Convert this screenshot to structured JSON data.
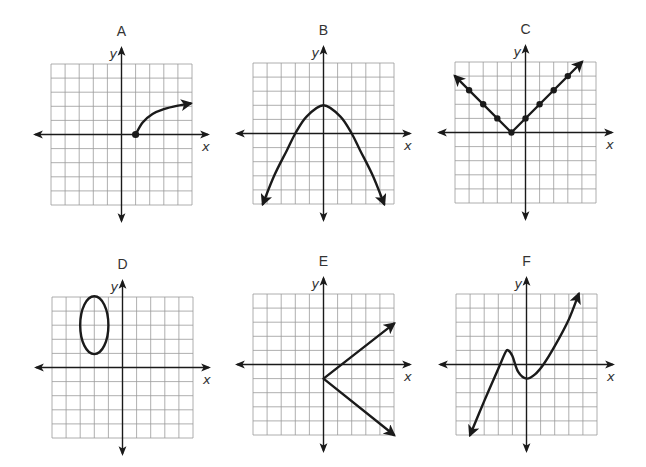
{
  "figure": {
    "panels": [
      {
        "label": "A",
        "x_label": "x",
        "y_label": "y",
        "grid": {
          "left": 51,
          "top": 64,
          "cell": 14.1,
          "cols": 10,
          "rows": 10
        },
        "description": "square-root-like curve starting at closed point (1,0) rising to the right with arrow",
        "graph": {
          "type": "curve",
          "points": [
            [
              1,
              0
            ],
            [
              1.5,
              0.85
            ],
            [
              2.2,
              1.45
            ],
            [
              3,
              1.8
            ],
            [
              4,
              2.05
            ],
            [
              4.9,
              2.2
            ]
          ],
          "start_dot": true,
          "end_arrow": true,
          "start_arrow": false
        }
      },
      {
        "label": "B",
        "x_label": "x",
        "y_label": "y",
        "grid": {
          "left": 253,
          "top": 63,
          "cell": 14.1,
          "cols": 10,
          "rows": 10
        },
        "description": "downward-opening parabola with vertex at (0,2), arrows on both ends",
        "graph": {
          "type": "curve",
          "points": [
            [
              -4.3,
              -5
            ],
            [
              -3.5,
              -3
            ],
            [
              -2.6,
              -1.2
            ],
            [
              -2,
              0
            ],
            [
              -1.2,
              1.2
            ],
            [
              0,
              2
            ],
            [
              1.2,
              1.2
            ],
            [
              2,
              0
            ],
            [
              2.6,
              -1.2
            ],
            [
              3.5,
              -3
            ],
            [
              4.3,
              -5
            ]
          ],
          "start_dot": false,
          "end_arrow": true,
          "start_arrow": true
        }
      },
      {
        "label": "C",
        "x_label": "x",
        "y_label": "y",
        "grid": {
          "left": 455,
          "top": 62,
          "cell": 14.1,
          "cols": 10,
          "rows": 10
        },
        "description": "absolute value V shape with vertex at (-1,0), dots at integer points, arrows at both ends",
        "graph": {
          "type": "polyline",
          "points": [
            [
              -5,
              4
            ],
            [
              -1,
              0
            ],
            [
              4,
              5
            ]
          ],
          "dots": [
            [
              -4,
              3
            ],
            [
              -3,
              2
            ],
            [
              -2,
              1
            ],
            [
              -1,
              0
            ],
            [
              0,
              1
            ],
            [
              1,
              2
            ],
            [
              2,
              3
            ],
            [
              3,
              4
            ]
          ],
          "end_arrow": true,
          "start_arrow": true
        }
      },
      {
        "label": "D",
        "x_label": "x",
        "y_label": "y",
        "grid": {
          "left": 52,
          "top": 297,
          "cell": 14.1,
          "cols": 10,
          "rows": 10
        },
        "description": "closed vertical ellipse centered at (-2,3) with rx 1 and ry 2",
        "graph": {
          "type": "ellipse",
          "cx": -2,
          "cy": 3,
          "rx": 1,
          "ry": 2.05
        }
      },
      {
        "label": "E",
        "x_label": "x",
        "y_label": "y",
        "grid": {
          "left": 253,
          "top": 294,
          "cell": 14.1,
          "cols": 10,
          "rows": 10
        },
        "description": "sideways V opening right with vertex at (0,-1), arrows at both ends",
        "graph": {
          "type": "polyline",
          "points": [
            [
              5,
              2.9
            ],
            [
              0,
              -1
            ],
            [
              5,
              -5
            ]
          ],
          "end_arrow": true,
          "start_arrow": true
        }
      },
      {
        "label": "F",
        "x_label": "x",
        "y_label": "y",
        "grid": {
          "left": 456,
          "top": 294,
          "cell": 14.1,
          "cols": 10,
          "rows": 10
        },
        "description": "cubic-like curve: rises from lower left through local max at (-1.3,1), local min at (0,-1), then rises to upper right; arrows both ends",
        "graph": {
          "type": "curve",
          "points": [
            [
              -4,
              -5
            ],
            [
              -3,
              -2.6
            ],
            [
              -2,
              -0.3
            ],
            [
              -1.5,
              0.85
            ],
            [
              -1.3,
              1
            ],
            [
              -1,
              0.6
            ],
            [
              -0.6,
              -0.5
            ],
            [
              0,
              -1
            ],
            [
              0.6,
              -0.7
            ],
            [
              1.2,
              0
            ],
            [
              2,
              1.3
            ],
            [
              3,
              3.2
            ],
            [
              3.7,
              5
            ]
          ],
          "start_dot": false,
          "end_arrow": true,
          "start_arrow": true
        }
      }
    ]
  }
}
